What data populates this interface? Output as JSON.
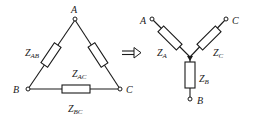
{
  "delta": {
    "nodes": {
      "A": "A",
      "B": "B",
      "C": "C"
    },
    "impedances": {
      "AB": {
        "main": "Z",
        "sub": "AB"
      },
      "AC": {
        "main": "Z",
        "sub": "AC"
      },
      "BC": {
        "main": "Z",
        "sub": "BC"
      }
    }
  },
  "arrow": {
    "symbol": "⇒",
    "meaning": "delta-to-wye transformation"
  },
  "wye": {
    "nodes": {
      "A": "A",
      "B": "B",
      "C": "C"
    },
    "impedances": {
      "A": {
        "main": "Z",
        "sub": "A"
      },
      "B": {
        "main": "Z",
        "sub": "B"
      },
      "C": {
        "main": "Z",
        "sub": "C"
      }
    }
  },
  "colors": {
    "stroke": "#1a1a1a",
    "background": "#ffffff"
  }
}
